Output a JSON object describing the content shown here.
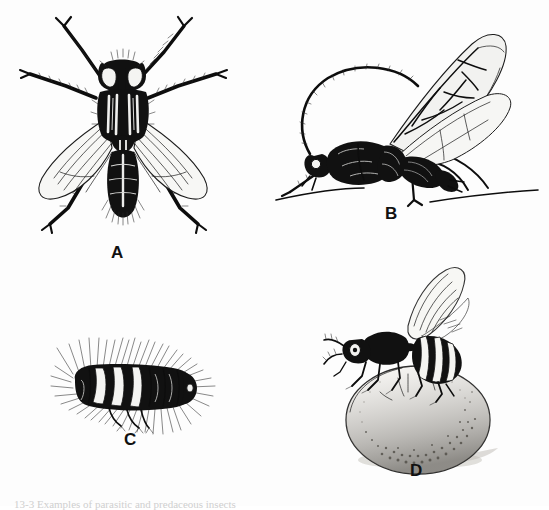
{
  "figure": {
    "kind": "scientific-illustration-plate",
    "background_color": "#fdfdfd",
    "ink_color": "#111111",
    "panel_count": 4,
    "caption_text": "13-3  Examples of parasitic and predaceous insects",
    "caption_visible": "partially cut off at bottom edge"
  },
  "panels": [
    {
      "id": "A",
      "label": "A",
      "subject": "house fly",
      "view": "dorsal",
      "label_x": 118,
      "label_y": 252
    },
    {
      "id": "B",
      "label": "B",
      "subject": "braconid parasitic wasp",
      "view": "lateral",
      "label_x": 390,
      "label_y": 212
    },
    {
      "id": "C",
      "label": "C",
      "subject": "hairy beetle larva",
      "view": "lateral",
      "label_x": 132,
      "label_y": 443
    },
    {
      "id": "D",
      "label": "D",
      "subject": "wasp ovipositing on host egg",
      "view": "lateral",
      "label_x": 416,
      "label_y": 473
    }
  ]
}
